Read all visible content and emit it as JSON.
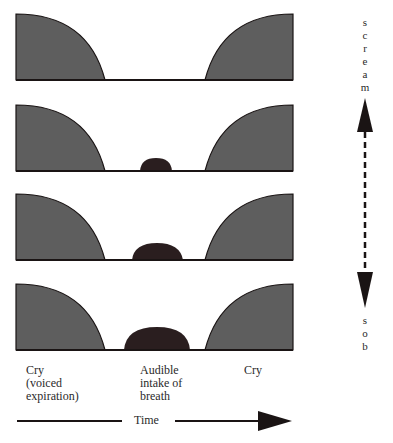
{
  "diagram": {
    "type": "cry-breathing-pattern-continuum",
    "colors": {
      "cry_fill": "#5e5e5e",
      "breath_fill": "#2a1e1f",
      "line": "#1a1414"
    },
    "panels": [
      {
        "id": 1,
        "breath_width": 0
      },
      {
        "id": 2,
        "breath_width": 32
      },
      {
        "id": 3,
        "breath_width": 50
      },
      {
        "id": 4,
        "breath_width": 66
      }
    ],
    "scale_axis": {
      "top_label": "scream",
      "bottom_label": "sob",
      "top_letters": [
        "s",
        "c",
        "r",
        "e",
        "a",
        "m"
      ],
      "bottom_letters": [
        "s",
        "o",
        "b"
      ]
    },
    "labels": {
      "cry_left": "Cry\n(voiced\nexpiration)",
      "breath": "Audible\nintake of\nbreath",
      "cry_right": "Cry"
    },
    "time_axis": {
      "label": "Time"
    }
  }
}
